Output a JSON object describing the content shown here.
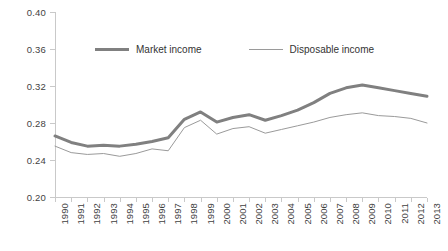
{
  "chart_data": {
    "type": "line",
    "title": "",
    "xlabel": "",
    "ylabel": "",
    "ylim": [
      0.2,
      0.4
    ],
    "yticks": [
      "0.20",
      "0.24",
      "0.28",
      "0.32",
      "0.36",
      "0.40"
    ],
    "ytick_values": [
      0.2,
      0.24,
      0.28,
      0.32,
      0.36,
      0.4
    ],
    "grid": false,
    "legend_position": "top-center",
    "categories": [
      "1990",
      "1991",
      "1992",
      "1993",
      "1994",
      "1995",
      "1996",
      "1997",
      "1998",
      "1999",
      "2000",
      "2001",
      "2002",
      "2003",
      "2004",
      "2005",
      "2006",
      "2007",
      "2008",
      "2009",
      "2010",
      "2011",
      "2012",
      "2013"
    ],
    "x": [
      1990,
      1991,
      1992,
      1993,
      1994,
      1995,
      1996,
      1997,
      1998,
      1999,
      2000,
      2001,
      2002,
      2003,
      2004,
      2005,
      2006,
      2007,
      2008,
      2009,
      2010,
      2011,
      2012,
      2013
    ],
    "series": [
      {
        "name": "Market income",
        "color": "#808080",
        "linewidth": 3,
        "values": [
          0.266,
          0.259,
          0.255,
          0.256,
          0.255,
          0.257,
          0.26,
          0.264,
          0.284,
          0.292,
          0.281,
          0.286,
          0.289,
          0.283,
          0.288,
          0.294,
          0.302,
          0.312,
          0.318,
          0.321,
          0.318,
          0.315,
          0.312,
          0.309
        ]
      },
      {
        "name": "Disposable income",
        "color": "#9a9a9a",
        "linewidth": 1,
        "values": [
          0.255,
          0.248,
          0.246,
          0.247,
          0.244,
          0.247,
          0.252,
          0.25,
          0.275,
          0.283,
          0.268,
          0.274,
          0.276,
          0.269,
          0.273,
          0.277,
          0.281,
          0.286,
          0.289,
          0.291,
          0.288,
          0.287,
          0.285,
          0.28
        ]
      }
    ]
  },
  "legend": {
    "items": [
      {
        "label": "Market income",
        "style": "thick"
      },
      {
        "label": "Disposable income",
        "style": "thin"
      }
    ]
  },
  "colors": {
    "market_income": "#808080",
    "disposable_income": "#9a9a9a",
    "axis": "#c9c9c9",
    "text": "#3f3f3f",
    "background": "#ffffff"
  }
}
